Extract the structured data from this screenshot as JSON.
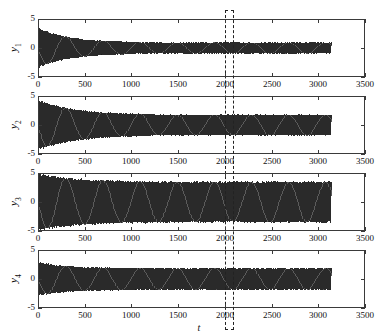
{
  "figure": {
    "xlabel": "t",
    "panels": [
      {
        "id": "y1",
        "ylabel": "y",
        "subscript": "1",
        "yticks": [
          "5",
          "0",
          "-5"
        ],
        "xticks": [
          "0",
          "500",
          "1000",
          "1500",
          "2000",
          "2500",
          "3000",
          "3500"
        ]
      },
      {
        "id": "y2",
        "ylabel": "y",
        "subscript": "2",
        "yticks": [
          "5",
          "0",
          "-5"
        ],
        "xticks": [
          "0",
          "500",
          "1000",
          "1500",
          "2000",
          "2500",
          "3000",
          "3500"
        ]
      },
      {
        "id": "y3",
        "ylabel": "y",
        "subscript": "3",
        "yticks": [
          "5",
          "0",
          "-5"
        ],
        "xticks": [
          "0",
          "500",
          "1000",
          "1500",
          "2000",
          "2500",
          "3000",
          "3500"
        ]
      },
      {
        "id": "y4",
        "ylabel": "y",
        "subscript": "4",
        "yticks": [
          "5",
          "0",
          "-5"
        ],
        "xticks": [
          "0",
          "500",
          "1000",
          "1500",
          "2000",
          "2500",
          "3000",
          "3500"
        ]
      }
    ],
    "annotation": {
      "name": "dashed-highlight-box",
      "t_start": 2000,
      "t_end": 2100
    }
  },
  "chart_data": {
    "type": "line",
    "title": "",
    "xlabel": "t",
    "ylabel": "",
    "xlim": [
      0,
      3500
    ],
    "ylim": [
      -5,
      5
    ],
    "xticks": [
      0,
      500,
      1000,
      1500,
      2000,
      2500,
      3000,
      3500
    ],
    "yticks": [
      -5,
      0,
      5
    ],
    "grid": false,
    "legend": "none",
    "data_end_t": 3140,
    "annotations": [
      {
        "type": "dashed-rectangle",
        "x_range": [
          2000,
          2100
        ],
        "spans": "all-subplots"
      }
    ],
    "series": [
      {
        "name": "y1",
        "ylabel": "y_1",
        "initial_amplitude": 3.4,
        "steady_amplitude": 0.95,
        "decay_end_t": 1050,
        "oscillation_period": 11,
        "description": "Damped oscillation decaying from about 3.4 to a steady limit cycle of about 0.95, signal ends near t=3140"
      },
      {
        "name": "y2",
        "ylabel": "y_2",
        "initial_amplitude": 4.3,
        "steady_amplitude": 1.75,
        "decay_end_t": 1250,
        "oscillation_period": 11,
        "description": "Damped oscillation decaying from about 4.3 to a steady limit cycle of about 1.75, signal ends near t=3140"
      },
      {
        "name": "y3",
        "ylabel": "y_3",
        "initial_amplitude": 4.9,
        "steady_amplitude": 3.45,
        "decay_end_t": 1300,
        "oscillation_period": 11,
        "description": "Largest amplitude, decaying from about 4.9 to a steady limit cycle of about 3.45, signal ends near t=3140"
      },
      {
        "name": "y4",
        "ylabel": "y_4",
        "initial_amplitude": 2.9,
        "steady_amplitude": 1.85,
        "decay_end_t": 900,
        "oscillation_period": 11,
        "description": "Damped oscillation decaying from about 2.9 to a steady limit cycle of about 1.85, signal ends near t=3140"
      }
    ]
  }
}
